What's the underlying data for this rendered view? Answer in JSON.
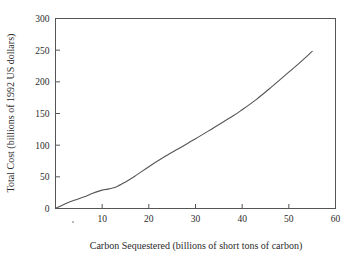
{
  "chart_data": {
    "type": "line",
    "title": "",
    "xlabel": "Carbon Sequestered (billions of short tons of carbon)",
    "ylabel": "Total Cost (billions of 1992 US dollars)",
    "xlim": [
      0,
      60
    ],
    "ylim": [
      0,
      300
    ],
    "grid": false,
    "legend": null,
    "xticks": [
      10,
      20,
      30,
      40,
      50,
      60
    ],
    "yticks": [
      0,
      50,
      100,
      150,
      200,
      250,
      300
    ],
    "xtick_labels": [
      "10",
      "20",
      "30",
      "40",
      "50",
      "60"
    ],
    "ytick_labels": [
      "0",
      "50",
      "100",
      "150",
      "200",
      "250",
      "300"
    ],
    "series": [
      {
        "name": "Total cost of carbon sequestration",
        "color": "#555555",
        "x": [
          0.0,
          2.0,
          4.0,
          6.0,
          8.0,
          10.0,
          11.5,
          13.0,
          15.0,
          17.0,
          20.0,
          23.0,
          26.0,
          30.0,
          34.0,
          38.0,
          40.0,
          43.0,
          46.0,
          49.0,
          52.0,
          55.0
        ],
        "y": [
          0.0,
          7.0,
          13.0,
          18.0,
          24.0,
          29.0,
          31.0,
          34.0,
          42.0,
          51.0,
          66.0,
          80.0,
          93.0,
          110.0,
          128.0,
          146.0,
          156.0,
          172.0,
          190.0,
          209.0,
          228.0,
          248.0
        ]
      }
    ],
    "axis_labels_x": [
      {
        "value": 10,
        "label": "10"
      },
      {
        "value": 20,
        "label": "20"
      },
      {
        "value": 30,
        "label": "30"
      },
      {
        "value": 40,
        "label": "40"
      },
      {
        "value": 50,
        "label": "50"
      },
      {
        "value": 60,
        "label": "60"
      }
    ],
    "axis_labels_y": [
      {
        "value": 0,
        "label": "0"
      },
      {
        "value": 50,
        "label": "50"
      },
      {
        "value": 100,
        "label": "100"
      },
      {
        "value": 150,
        "label": "150"
      },
      {
        "value": 200,
        "label": "200"
      },
      {
        "value": 250,
        "label": "250"
      },
      {
        "value": 300,
        "label": "300"
      }
    ]
  }
}
